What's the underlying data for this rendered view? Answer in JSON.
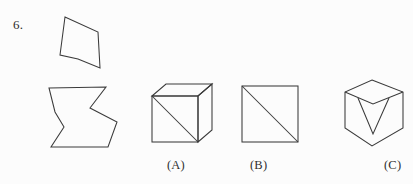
{
  "page": {
    "background_color": "#fcfcfc",
    "ink_color": "#3a3a3a",
    "text_color": "#2b2b2b",
    "width": 413,
    "height": 184
  },
  "question": {
    "number_label": "6.",
    "type": "visual-puzzle-multiple-choice"
  },
  "prompt_figures": [
    {
      "name": "dart-quadrilateral",
      "description": "concave quadrilateral (dart / arrowhead) outline",
      "points": "65,17 98,32 100,68 78,59 60,55"
    },
    {
      "name": "chevron-polygon",
      "description": "thick right-pointing chevron / zigzag arrow outline",
      "points": "49,88 106,87 90,108 117,122 108,147 51,147 64,127 55,112"
    }
  ],
  "options": [
    {
      "key": "A",
      "label": "(A)",
      "figure_name": "cube-with-face-diagonal",
      "description": "oblique cube outline with a diagonal across the front face"
    },
    {
      "key": "B",
      "label": "(B)",
      "figure_name": "square-with-diagonal",
      "description": "square outline with a diagonal from top-left to bottom-right"
    },
    {
      "key": "C",
      "label": "(C)",
      "figure_name": "hexagon-with-v-notch",
      "description": "hexagon (isometric cube silhouette) with a V notch at the top-center, partially cropped at the right page edge"
    }
  ]
}
